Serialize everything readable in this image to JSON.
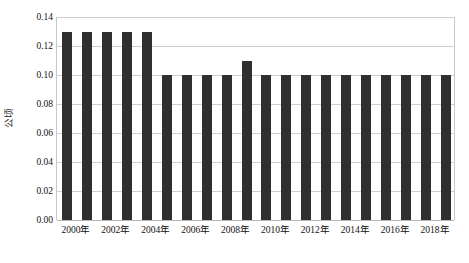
{
  "chart_data": {
    "type": "bar",
    "title": "",
    "xlabel": "",
    "ylabel": "公顷",
    "ylim": [
      0.0,
      0.14
    ],
    "grid": true,
    "legend": "none",
    "bar_color": "#2f2f2f",
    "gridline_color": "#cfcfcf",
    "categories": [
      "2000年",
      "2001年",
      "2002年",
      "2003年",
      "2004年",
      "2005年",
      "2006年",
      "2007年",
      "2008年",
      "2009年",
      "2010年",
      "2011年",
      "2012年",
      "2013年",
      "2014年",
      "2015年",
      "2016年",
      "2017年",
      "2018年",
      "2019年"
    ],
    "values": [
      0.13,
      0.13,
      0.13,
      0.13,
      0.13,
      0.1,
      0.1,
      0.1,
      0.1,
      0.11,
      0.1,
      0.1,
      0.1,
      0.1,
      0.1,
      0.1,
      0.1,
      0.1,
      0.1,
      0.1
    ],
    "y_ticks": [
      0.0,
      0.02,
      0.04,
      0.06,
      0.08,
      0.1,
      0.12,
      0.14
    ],
    "y_tick_labels": [
      "0.00",
      "0.02",
      "0.04",
      "0.06",
      "0.08",
      "0.10",
      "0.12",
      "0.14"
    ],
    "x_tick_labels": [
      "2000年",
      "2002年",
      "2004年",
      "2006年",
      "2008年",
      "2010年",
      "2012年",
      "2014年",
      "2016年",
      "2018年"
    ],
    "x_tick_indices": [
      0,
      2,
      4,
      6,
      8,
      10,
      12,
      14,
      16,
      18
    ]
  }
}
